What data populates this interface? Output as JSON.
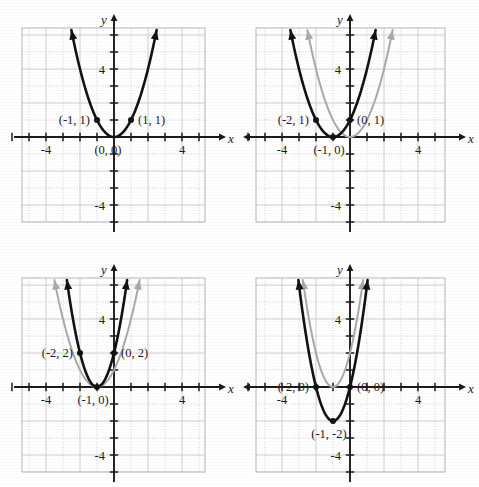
{
  "figure": {
    "type": "multi-panel-graph",
    "panel_count": 4,
    "layout": "2x2",
    "axis_labels": {
      "x": "x",
      "y": "y"
    },
    "tick_labels": {
      "x_positive": "4",
      "x_negative": "-4",
      "y_positive": "4",
      "y_negative": "-4"
    },
    "colors": {
      "curve_main": "#111111",
      "curve_reference": "#a9a9a9",
      "grid_solid": "#c8c8c8",
      "grid_dotted": "#bdbdbd",
      "axis": "#1a1a1a",
      "frame": "#b5b5b5",
      "background": "#ffffff",
      "text": "#1a1a1a"
    }
  },
  "chart_data": [
    {
      "type": "line",
      "panel": 1,
      "title": "",
      "xlabel": "x",
      "ylabel": "y",
      "xlim": [
        -6,
        6
      ],
      "ylim": [
        -6,
        6
      ],
      "xticks": [
        -4,
        4
      ],
      "yticks": [
        -4,
        4
      ],
      "grid": true,
      "series": [
        {
          "name": "y = x^2",
          "style": "solid-black",
          "vertex": [
            0,
            0
          ],
          "a": 1,
          "h": 0,
          "k": 0,
          "x": [
            -2.45,
            -2.2,
            -2.0,
            -1.75,
            -1.5,
            -1.25,
            -1.0,
            -0.75,
            -0.5,
            -0.25,
            0,
            0.25,
            0.5,
            0.75,
            1.0,
            1.25,
            1.5,
            1.75,
            2.0,
            2.2,
            2.45
          ],
          "y": [
            6.0,
            4.84,
            4.0,
            3.06,
            2.25,
            1.56,
            1.0,
            0.56,
            0.25,
            0.06,
            0,
            0.06,
            0.25,
            0.56,
            1.0,
            1.56,
            2.25,
            3.06,
            4.0,
            4.84,
            6.0
          ]
        }
      ],
      "points": [
        {
          "label": "(-1, 1)",
          "x": -1,
          "y": 1,
          "label_side": "left"
        },
        {
          "label": "(1, 1)",
          "x": 1,
          "y": 1,
          "label_side": "right"
        },
        {
          "label": "(0, 0)",
          "x": 0,
          "y": 0,
          "label_side": "below-left"
        }
      ]
    },
    {
      "type": "line",
      "panel": 2,
      "title": "",
      "xlabel": "x",
      "ylabel": "y",
      "xlim": [
        -6,
        6
      ],
      "ylim": [
        -6,
        6
      ],
      "xticks": [
        -4,
        4
      ],
      "yticks": [
        -4,
        4
      ],
      "grid": true,
      "series": [
        {
          "name": "y = (x + 1)^2",
          "style": "solid-black",
          "vertex": [
            -1,
            0
          ],
          "a": 1,
          "h": -1,
          "k": 0,
          "x": [
            -3.45,
            -3.2,
            -3.0,
            -2.75,
            -2.5,
            -2.25,
            -2.0,
            -1.75,
            -1.5,
            -1.25,
            -1.0,
            -0.75,
            -0.5,
            -0.25,
            0,
            0.25,
            0.5,
            0.75,
            1.0,
            1.2,
            1.45
          ],
          "y": [
            6.0,
            4.84,
            4.0,
            3.06,
            2.25,
            1.56,
            1.0,
            0.56,
            0.25,
            0.06,
            0,
            0.06,
            0.25,
            0.56,
            1.0,
            1.56,
            2.25,
            3.06,
            4.0,
            4.84,
            6.0
          ]
        },
        {
          "name": "y = x^2",
          "style": "solid-gray",
          "vertex": [
            0,
            0
          ],
          "a": 1,
          "h": 0,
          "k": 0,
          "x": [
            -2.45,
            -2.2,
            -2.0,
            -1.75,
            -1.5,
            -1.25,
            -1.0,
            -0.75,
            -0.5,
            -0.25,
            0,
            0.25,
            0.5,
            0.75,
            1.0,
            1.25,
            1.5,
            1.75,
            2.0,
            2.2,
            2.45
          ],
          "y": [
            6.0,
            4.84,
            4.0,
            3.06,
            2.25,
            1.56,
            1.0,
            0.56,
            0.25,
            0.06,
            0,
            0.06,
            0.25,
            0.56,
            1.0,
            1.56,
            2.25,
            3.06,
            4.0,
            4.84,
            6.0
          ]
        }
      ],
      "points": [
        {
          "label": "(-2, 1)",
          "x": -2,
          "y": 1,
          "label_side": "left"
        },
        {
          "label": "(0, 1)",
          "x": 0,
          "y": 1,
          "label_side": "right"
        },
        {
          "label": "(-1, 0)",
          "x": -1,
          "y": 0,
          "label_side": "below"
        }
      ]
    },
    {
      "type": "line",
      "panel": 3,
      "title": "",
      "xlabel": "x",
      "ylabel": "y",
      "xlim": [
        -6,
        6
      ],
      "ylim": [
        -6,
        6
      ],
      "xticks": [
        -4,
        4
      ],
      "yticks": [
        -4,
        4
      ],
      "grid": true,
      "series": [
        {
          "name": "y = 2(x + 1)^2",
          "style": "solid-black",
          "vertex": [
            -1,
            0
          ],
          "a": 2,
          "h": -1,
          "k": 0,
          "x": [
            -2.73,
            -2.5,
            -2.25,
            -2.0,
            -1.8,
            -1.6,
            -1.4,
            -1.2,
            -1.0,
            -0.8,
            -0.6,
            -0.4,
            -0.2,
            0,
            0.25,
            0.5,
            0.73
          ],
          "y": [
            5.99,
            4.5,
            3.13,
            2.0,
            1.28,
            0.72,
            0.32,
            0.08,
            0,
            0.08,
            0.32,
            0.72,
            1.28,
            2.0,
            3.13,
            4.5,
            5.99
          ]
        },
        {
          "name": "y = (x + 1)^2",
          "style": "solid-gray",
          "vertex": [
            -1,
            0
          ],
          "a": 1,
          "h": -1,
          "k": 0,
          "x": [
            -3.45,
            -3.2,
            -3.0,
            -2.75,
            -2.5,
            -2.25,
            -2.0,
            -1.75,
            -1.5,
            -1.25,
            -1.0,
            -0.75,
            -0.5,
            -0.25,
            0,
            0.25,
            0.5,
            0.75,
            1.0,
            1.2,
            1.45
          ],
          "y": [
            6.0,
            4.84,
            4.0,
            3.06,
            2.25,
            1.56,
            1.0,
            0.56,
            0.25,
            0.06,
            0,
            0.06,
            0.25,
            0.56,
            1.0,
            1.56,
            2.25,
            3.06,
            4.0,
            4.84,
            6.0
          ]
        }
      ],
      "points": [
        {
          "label": "(-2, 2)",
          "x": -2,
          "y": 2,
          "label_side": "left"
        },
        {
          "label": "(0, 2)",
          "x": 0,
          "y": 2,
          "label_side": "right"
        },
        {
          "label": "(-1, 0)",
          "x": -1,
          "y": 0,
          "label_side": "below"
        }
      ]
    },
    {
      "type": "line",
      "panel": 4,
      "title": "",
      "xlabel": "x",
      "ylabel": "y",
      "xlim": [
        -6,
        6
      ],
      "ylim": [
        -6,
        6
      ],
      "xticks": [
        -4,
        4
      ],
      "yticks": [
        -4,
        4
      ],
      "grid": true,
      "series": [
        {
          "name": "y = 2(x + 1)^2 - 2",
          "style": "solid-black",
          "vertex": [
            -1,
            -2
          ],
          "a": 2,
          "h": -1,
          "k": -2,
          "x": [
            -3.0,
            -2.75,
            -2.5,
            -2.25,
            -2.0,
            -1.8,
            -1.6,
            -1.4,
            -1.2,
            -1.0,
            -0.8,
            -0.6,
            -0.4,
            -0.2,
            0,
            0.25,
            0.5,
            0.75,
            1.0
          ],
          "y": [
            6.0,
            4.13,
            2.5,
            1.13,
            0.0,
            -0.72,
            -1.28,
            -1.68,
            -1.92,
            -2.0,
            -1.92,
            -1.68,
            -1.28,
            -0.72,
            0.0,
            1.13,
            2.5,
            4.13,
            6.0
          ]
        },
        {
          "name": "y = 2(x + 1)^2",
          "style": "solid-gray",
          "vertex": [
            -1,
            0
          ],
          "a": 2,
          "h": -1,
          "k": 0,
          "x": [
            -2.73,
            -2.5,
            -2.25,
            -2.0,
            -1.8,
            -1.6,
            -1.4,
            -1.2,
            -1.0,
            -0.8,
            -0.6,
            -0.4,
            -0.2,
            0,
            0.25,
            0.5,
            0.73
          ],
          "y": [
            5.99,
            4.5,
            3.13,
            2.0,
            1.28,
            0.72,
            0.32,
            0.08,
            0,
            0.08,
            0.32,
            0.72,
            1.28,
            2.0,
            3.13,
            4.5,
            5.99
          ]
        }
      ],
      "points": [
        {
          "label": "(-2, 0)",
          "x": -2,
          "y": 0,
          "label_side": "left"
        },
        {
          "label": "(0, 0)",
          "x": 0,
          "y": 0,
          "label_side": "right"
        },
        {
          "label": "(-1, -2)",
          "x": -1,
          "y": -2,
          "label_side": "below"
        }
      ]
    }
  ]
}
